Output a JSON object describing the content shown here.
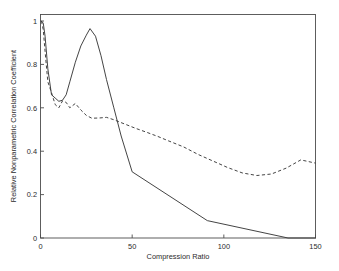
{
  "chart_data": {
    "type": "line",
    "title": "",
    "xlabel": "Compression Ratio",
    "ylabel": "Relative Nonparametric Correlation Coefficient",
    "xlim": [
      0,
      150
    ],
    "ylim": [
      0,
      1.03
    ],
    "xticks": [
      0,
      50,
      100,
      150
    ],
    "xticklabels": [
      "0",
      "50",
      "100",
      "150"
    ],
    "yticks": [
      0,
      0.2,
      0.4,
      0.6,
      0.8,
      1
    ],
    "yticklabels": [
      "0",
      "0.2",
      "0.4",
      "0.6",
      "0.8",
      "1"
    ],
    "grid": false,
    "legend": "none",
    "box": true,
    "series": [
      {
        "name": "solid-curve",
        "style": "solid",
        "color": "#3a3a3a",
        "x": [
          0.5,
          1.5,
          2.5,
          4,
          6,
          8,
          10,
          12,
          14,
          16,
          19,
          22,
          25,
          27,
          30,
          33,
          36,
          40,
          44,
          50,
          91,
          135,
          150
        ],
        "y": [
          1.0,
          0.99,
          0.93,
          0.78,
          0.66,
          0.645,
          0.63,
          0.635,
          0.66,
          0.72,
          0.81,
          0.885,
          0.935,
          0.965,
          0.93,
          0.84,
          0.73,
          0.6,
          0.47,
          0.305,
          0.08,
          0.0,
          0.0
        ]
      },
      {
        "name": "dashed-curve",
        "style": "dashed",
        "color": "#3a3a3a",
        "x": [
          0.5,
          1.5,
          2.5,
          4,
          6,
          8,
          10,
          12,
          14,
          16,
          19,
          22,
          25,
          28,
          32,
          36,
          40,
          46,
          52,
          58,
          64,
          70,
          78,
          86,
          94,
          102,
          110,
          118,
          126,
          134,
          142,
          150
        ],
        "y": [
          1.0,
          0.96,
          0.86,
          0.72,
          0.67,
          0.615,
          0.6,
          0.632,
          0.625,
          0.6,
          0.62,
          0.59,
          0.565,
          0.552,
          0.553,
          0.556,
          0.545,
          0.525,
          0.505,
          0.487,
          0.468,
          0.447,
          0.42,
          0.385,
          0.355,
          0.325,
          0.3,
          0.288,
          0.295,
          0.322,
          0.36,
          0.345
        ]
      }
    ]
  }
}
